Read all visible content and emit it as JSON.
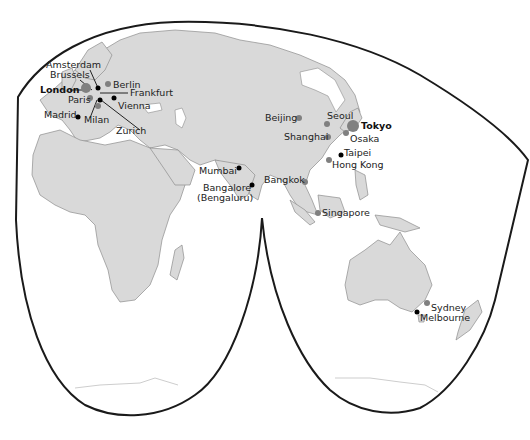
{
  "map": {
    "projection": "interrupted world map (Eastern Hemisphere)",
    "colors": {
      "land": "#d9d9d9",
      "coast": "#8c8c8c",
      "major_hub": "#808080",
      "city_black": "#000000",
      "frame": "#1a1a1a"
    },
    "cities": [
      {
        "name": "Amsterdam",
        "marker": "grey-dot"
      },
      {
        "name": "Brussels",
        "marker": "grey-dot"
      },
      {
        "name": "London",
        "marker": "large-grey-dot",
        "bold": true
      },
      {
        "name": "Paris",
        "marker": "grey-dot"
      },
      {
        "name": "Berlin",
        "marker": "grey-dot"
      },
      {
        "name": "Frankfurt",
        "marker": "black-dot"
      },
      {
        "name": "Vienna",
        "marker": "black-dot"
      },
      {
        "name": "Madrid",
        "marker": "black-dot"
      },
      {
        "name": "Milan",
        "marker": "grey-dot"
      },
      {
        "name": "Zurich",
        "marker": "black-dot"
      },
      {
        "name": "Mumbai",
        "marker": "black-dot"
      },
      {
        "name": "Bangalore",
        "marker": "black-dot"
      },
      {
        "name": "(Bengaluru)",
        "marker": "none"
      },
      {
        "name": "Beijing",
        "marker": "grey-dot"
      },
      {
        "name": "Seoul",
        "marker": "grey-dot"
      },
      {
        "name": "Shanghai",
        "marker": "grey-dot"
      },
      {
        "name": "Tokyo",
        "marker": "large-grey-dot",
        "bold": true
      },
      {
        "name": "Osaka",
        "marker": "grey-dot"
      },
      {
        "name": "Taipei",
        "marker": "black-dot"
      },
      {
        "name": "Hong Kong",
        "marker": "grey-dot"
      },
      {
        "name": "Bangkok",
        "marker": "grey-dot"
      },
      {
        "name": "Singapore",
        "marker": "grey-dot"
      },
      {
        "name": "Sydney",
        "marker": "grey-dot"
      },
      {
        "name": "Melbourne",
        "marker": "black-dot"
      }
    ]
  }
}
